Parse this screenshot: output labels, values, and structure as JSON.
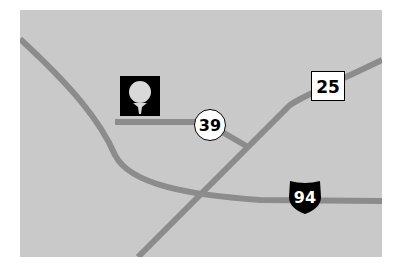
{
  "map": {
    "background_color": "#c9c9c9",
    "road_color": "#8c8c8c",
    "routes": [
      {
        "id": "route-25",
        "label": "25",
        "shield": "state-square"
      },
      {
        "id": "route-39",
        "label": "39",
        "shield": "county-circle"
      },
      {
        "id": "interstate-94",
        "label": "94",
        "shield": "interstate"
      }
    ],
    "poi": {
      "name": "golf-course",
      "icon": "golf-ball-on-tee-icon"
    }
  }
}
